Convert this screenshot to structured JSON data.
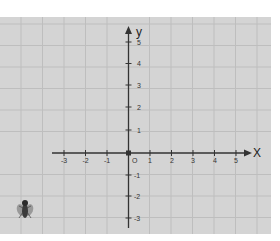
{
  "graph": {
    "x_axis_label": "X",
    "y_axis_label": "y",
    "origin_label": "O",
    "x_ticks": [
      "-3",
      "-2",
      "-1",
      "1",
      "2",
      "3",
      "4",
      "5"
    ],
    "y_ticks": [
      "5",
      "4",
      "3",
      "2",
      "1",
      "-1",
      "-2",
      "-3"
    ],
    "x_range": [
      -3,
      5
    ],
    "y_range": [
      -3,
      5
    ],
    "grid": true,
    "colors": {
      "paper": "#d4d4d4",
      "grid": "#bdbdbd",
      "axis": "#333333"
    }
  },
  "decoration": {
    "icon": "fly-icon"
  }
}
